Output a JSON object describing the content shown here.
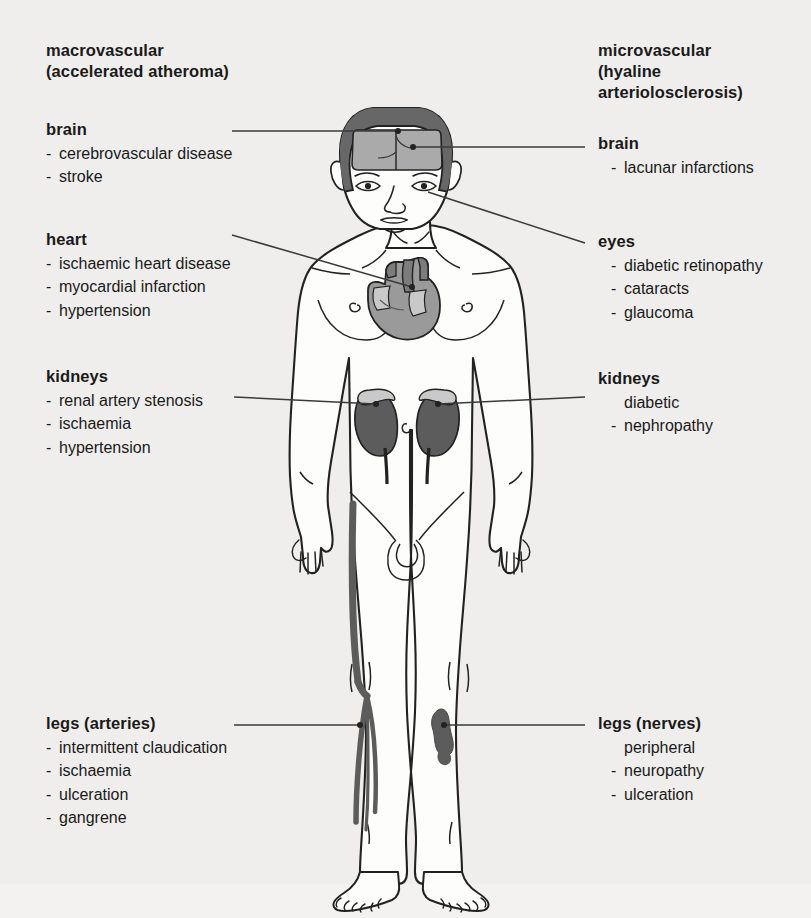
{
  "figure": {
    "type": "annotated-anatomical-diagram",
    "background_color": "#efeeec",
    "organ_colors": {
      "scalp_hair": "#676767",
      "brain_window": "#aaaaaa",
      "heart": "#9a9a9a",
      "heart_vessels": "#7c7c7c",
      "heart_highlight": "#c9c9c9",
      "kidney": "#5c5c5c",
      "adrenal": "#c9c9c9",
      "leg_artery": "#5c5c5c",
      "leg_ulcer": "#5c5c5c",
      "body_fill": "#fdfdfb",
      "outline": "#222222"
    }
  },
  "columns": {
    "left": {
      "heading": "macrovascular\n(accelerated atheroma)",
      "blocks": [
        {
          "title": "brain",
          "items": [
            "cerebrovascular disease",
            "stroke"
          ]
        },
        {
          "title": "heart",
          "items": [
            "ischaemic heart disease",
            "myocardial infarction",
            "hypertension"
          ]
        },
        {
          "title": "kidneys",
          "items": [
            "renal artery stenosis",
            "ischaemia",
            "hypertension"
          ]
        },
        {
          "title": "legs (arteries)",
          "items": [
            "intermittent claudication",
            "ischaemia",
            "ulceration",
            "gangrene"
          ]
        }
      ]
    },
    "right": {
      "heading": "microvascular\n(hyaline\narteriolosclerosis)",
      "blocks": [
        {
          "title": "brain",
          "items": [
            "lacunar infarctions"
          ]
        },
        {
          "title": "eyes",
          "items": [
            "diabetic retinopathy",
            "cataracts",
            "glaucoma"
          ]
        },
        {
          "title": "kidneys",
          "items": [
            "diabetic\nnephropathy"
          ]
        },
        {
          "title": "legs (nerves)",
          "items": [
            "peripheral\nneuropathy",
            "ulceration"
          ]
        }
      ]
    }
  },
  "leaders": [
    {
      "name": "brain-left",
      "from": "label",
      "to": "brain"
    },
    {
      "name": "heart-left",
      "from": "label",
      "to": "heart"
    },
    {
      "name": "kidneys-left",
      "from": "label",
      "to": "left-kidney"
    },
    {
      "name": "legs-left",
      "from": "label",
      "to": "left-leg-artery"
    },
    {
      "name": "brain-right",
      "from": "label",
      "to": "brain"
    },
    {
      "name": "eyes-right",
      "from": "label",
      "to": "right-eye"
    },
    {
      "name": "kidneys-right",
      "from": "label",
      "to": "right-kidney"
    },
    {
      "name": "legs-right",
      "from": "label",
      "to": "right-leg-ulcer"
    }
  ]
}
